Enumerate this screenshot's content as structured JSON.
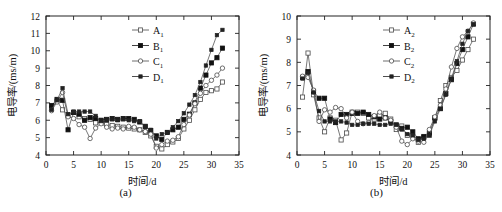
{
  "figure": {
    "panels": [
      {
        "caption": "(a)",
        "name": "panel-a",
        "chart_index": 0
      },
      {
        "caption": "(b)",
        "name": "panel-b",
        "chart_index": 1
      }
    ]
  },
  "chart_data": [
    {
      "type": "line",
      "title": "",
      "subtitle": "",
      "caption": "(a)",
      "xlabel": "时间/d",
      "ylabel": "电导率/(ms/m)",
      "xlim": [
        0,
        35
      ],
      "ylim": [
        4,
        12
      ],
      "xticks": [
        0,
        5,
        10,
        15,
        20,
        25,
        30,
        35
      ],
      "yticks": [
        4,
        5,
        6,
        7,
        8,
        9,
        10,
        11,
        12
      ],
      "xtick_labels": [
        "0",
        "5",
        "10",
        "15",
        "20",
        "25",
        "30",
        "35"
      ],
      "ytick_labels": [
        "4",
        "5",
        "6",
        "7",
        "8",
        "9",
        "10",
        "11",
        "12"
      ],
      "grid": false,
      "legend_position": "top-center",
      "series": [
        {
          "name": "A₁",
          "label_base": "A",
          "label_sub": "1",
          "marker": "open-square",
          "color": "#4a4a4a",
          "x": [
            1,
            2,
            3,
            4,
            5,
            6,
            7,
            8,
            9,
            10,
            11,
            12,
            13,
            14,
            15,
            16,
            17,
            18,
            19,
            20,
            21,
            22,
            23,
            24,
            25,
            26,
            27,
            28,
            29,
            30,
            31,
            32
          ],
          "y": [
            6.7,
            7.1,
            6.6,
            6.3,
            6.45,
            6.2,
            6.1,
            6.05,
            5.85,
            5.9,
            5.75,
            5.7,
            5.65,
            5.6,
            5.55,
            5.5,
            5.45,
            5.3,
            5.1,
            4.5,
            4.35,
            4.6,
            4.75,
            4.95,
            5.5,
            6.0,
            6.6,
            7.2,
            7.6,
            7.7,
            7.8,
            8.2
          ]
        },
        {
          "name": "B₁",
          "label_base": "B",
          "label_sub": "1",
          "marker": "filled-square",
          "color": "#111111",
          "x": [
            1,
            2,
            3,
            4,
            5,
            6,
            7,
            8,
            9,
            10,
            11,
            12,
            13,
            14,
            15,
            16,
            17,
            18,
            19,
            20,
            21,
            22,
            23,
            24,
            25,
            26,
            27,
            28,
            29,
            30,
            31,
            32
          ],
          "y": [
            6.85,
            7.2,
            7.15,
            5.45,
            6.45,
            6.35,
            6.0,
            6.15,
            6.1,
            6.0,
            6.05,
            6.1,
            6.05,
            6.1,
            6.1,
            6.05,
            5.9,
            5.65,
            5.4,
            5.1,
            4.9,
            5.3,
            5.45,
            5.6,
            6.05,
            6.35,
            7.0,
            7.85,
            8.6,
            9.3,
            9.6,
            10.15
          ]
        },
        {
          "name": "C₁",
          "label_base": "C",
          "label_sub": "1",
          "marker": "open-circle",
          "color": "#4a4a4a",
          "x": [
            1,
            2,
            3,
            4,
            5,
            6,
            7,
            8,
            9,
            10,
            11,
            12,
            13,
            14,
            15,
            16,
            17,
            18,
            19,
            20,
            21,
            22,
            23,
            24,
            25,
            26,
            27,
            28,
            29,
            30,
            31,
            32
          ],
          "y": [
            6.55,
            7.05,
            7.6,
            6.2,
            6.1,
            5.75,
            5.6,
            4.95,
            5.55,
            5.8,
            5.6,
            5.5,
            5.55,
            5.5,
            5.65,
            5.6,
            5.45,
            5.35,
            5.2,
            4.4,
            4.6,
            4.8,
            4.85,
            5.05,
            5.75,
            6.3,
            6.95,
            7.55,
            8.0,
            8.3,
            8.6,
            9.0
          ]
        },
        {
          "name": "D₁",
          "label_base": "D",
          "label_sub": "1",
          "marker": "filled-square-small",
          "color": "#222222",
          "x": [
            1,
            2,
            3,
            4,
            5,
            6,
            7,
            8,
            9,
            10,
            11,
            12,
            13,
            14,
            15,
            16,
            17,
            18,
            19,
            20,
            21,
            22,
            23,
            24,
            25,
            26,
            27,
            28,
            29,
            30,
            31,
            32
          ],
          "y": [
            6.6,
            7.15,
            7.85,
            6.35,
            6.5,
            6.5,
            6.5,
            6.5,
            6.25,
            5.95,
            6.0,
            6.05,
            6.0,
            6.05,
            6.0,
            5.95,
            5.95,
            5.6,
            5.45,
            4.95,
            5.2,
            5.3,
            5.6,
            5.95,
            6.4,
            6.9,
            7.45,
            8.2,
            9.15,
            10.05,
            10.9,
            11.2
          ]
        }
      ]
    },
    {
      "type": "line",
      "title": "",
      "subtitle": "",
      "caption": "(b)",
      "xlabel": "时间/d",
      "ylabel": "电导率/(ms/m)",
      "xlim": [
        0,
        35
      ],
      "ylim": [
        4,
        10
      ],
      "xticks": [
        0,
        5,
        10,
        15,
        20,
        25,
        30,
        35
      ],
      "yticks": [
        4,
        5,
        6,
        7,
        8,
        9,
        10
      ],
      "xtick_labels": [
        "0",
        "5",
        "10",
        "15",
        "20",
        "25",
        "30",
        "35"
      ],
      "ytick_labels": [
        "4",
        "5",
        "6",
        "7",
        "8",
        "9",
        "10"
      ],
      "grid": false,
      "legend_position": "top-center",
      "series": [
        {
          "name": "A₂",
          "label_base": "A",
          "label_sub": "2",
          "marker": "open-square",
          "color": "#4a4a4a",
          "x": [
            1,
            2,
            3,
            4,
            5,
            6,
            7,
            8,
            9,
            10,
            11,
            12,
            13,
            14,
            15,
            16,
            17,
            18,
            19,
            20,
            21,
            22,
            23,
            24,
            25,
            26,
            27,
            28,
            29,
            30,
            31,
            32
          ],
          "y": [
            6.5,
            8.4,
            6.6,
            5.6,
            5.0,
            5.6,
            5.5,
            4.65,
            4.95,
            5.85,
            5.85,
            5.8,
            5.6,
            5.55,
            5.7,
            5.8,
            5.55,
            5.1,
            5.25,
            4.85,
            4.8,
            4.55,
            4.75,
            4.85,
            5.6,
            6.35,
            7.0,
            7.35,
            7.65,
            8.1,
            8.55,
            9.0
          ]
        },
        {
          "name": "B₂",
          "label_base": "B",
          "label_sub": "2",
          "marker": "filled-square",
          "color": "#111111",
          "x": [
            1,
            2,
            3,
            4,
            5,
            6,
            7,
            8,
            9,
            10,
            11,
            12,
            13,
            14,
            15,
            16,
            17,
            18,
            19,
            20,
            21,
            22,
            23,
            24,
            25,
            26,
            27,
            28,
            29,
            30,
            31,
            32
          ],
          "y": [
            7.35,
            7.6,
            6.75,
            6.45,
            6.45,
            5.55,
            5.4,
            5.75,
            5.75,
            5.8,
            5.8,
            5.85,
            5.75,
            5.65,
            5.55,
            5.6,
            5.45,
            5.3,
            5.15,
            5.2,
            5.0,
            4.7,
            4.8,
            4.95,
            5.6,
            6.0,
            6.65,
            7.25,
            7.95,
            8.55,
            9.1,
            9.65
          ]
        },
        {
          "name": "C₂",
          "label_base": "C",
          "label_sub": "2",
          "marker": "open-circle",
          "color": "#4a4a4a",
          "x": [
            1,
            2,
            3,
            4,
            5,
            6,
            7,
            8,
            9,
            10,
            11,
            12,
            13,
            14,
            15,
            16,
            17,
            18,
            19,
            20,
            21,
            22,
            23,
            24,
            25,
            26,
            27,
            28,
            29,
            30,
            31,
            32
          ],
          "y": [
            7.4,
            7.35,
            6.8,
            5.45,
            5.95,
            5.85,
            6.05,
            6.0,
            5.6,
            5.85,
            5.45,
            5.35,
            5.4,
            5.7,
            5.85,
            5.6,
            5.5,
            5.2,
            4.6,
            4.45,
            4.7,
            4.6,
            4.55,
            5.1,
            5.65,
            6.15,
            6.85,
            7.8,
            8.6,
            9.1,
            9.35,
            9.7
          ]
        },
        {
          "name": "D₂",
          "label_base": "D",
          "label_sub": "2",
          "marker": "filled-square-small",
          "color": "#222222",
          "x": [
            1,
            2,
            3,
            4,
            5,
            6,
            7,
            8,
            9,
            10,
            11,
            12,
            13,
            14,
            15,
            16,
            17,
            18,
            19,
            20,
            21,
            22,
            23,
            24,
            25,
            26,
            27,
            28,
            29,
            30,
            31,
            32
          ],
          "y": [
            7.3,
            7.55,
            6.7,
            5.9,
            5.45,
            5.45,
            5.45,
            5.45,
            5.4,
            5.3,
            5.3,
            5.35,
            5.35,
            5.35,
            5.3,
            5.3,
            5.35,
            5.3,
            5.1,
            4.9,
            4.85,
            4.65,
            4.7,
            4.85,
            5.45,
            6.0,
            6.6,
            7.3,
            8.05,
            8.8,
            9.35,
            9.65
          ]
        }
      ]
    }
  ]
}
